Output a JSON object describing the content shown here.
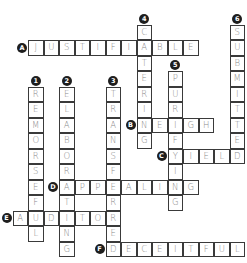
{
  "puzzle": {
    "grid": {
      "origin_x": 28,
      "origin_y": 40,
      "cell": 15.5
    },
    "colors": {
      "badge": "#1e1e1e",
      "border": "#3a3a3a",
      "letter": "#8a8a8a"
    },
    "across": [
      {
        "label": "A",
        "answer": "JUSTIFIABLE",
        "row": 0,
        "col": 0
      },
      {
        "label": "B",
        "answer": "NEIGH",
        "row": 5,
        "col": 7
      },
      {
        "label": "C",
        "answer": "YIELD",
        "row": 7,
        "col": 9
      },
      {
        "label": "D",
        "answer": "APPEALING",
        "row": 9,
        "col": 2
      },
      {
        "label": "E",
        "answer": "AUDITOR",
        "row": 11,
        "col": -1
      },
      {
        "label": "F",
        "answer": "DECEITFUL",
        "row": 13,
        "col": 5
      }
    ],
    "down": [
      {
        "label": "1",
        "answer": "REMORSEFUL",
        "row": 3,
        "col": 0
      },
      {
        "label": "2",
        "answer": "ELABORATING",
        "row": 3,
        "col": 2
      },
      {
        "label": "3",
        "answer": "TRANSFERRED",
        "row": 3,
        "col": 5
      },
      {
        "label": "4",
        "answer": "CATERING",
        "row": -1,
        "col": 7
      },
      {
        "label": "5",
        "answer": "PURIFYING",
        "row": 2,
        "col": 9
      },
      {
        "label": "6",
        "answer": "SUBMITTED",
        "row": -1,
        "col": 13
      }
    ]
  }
}
